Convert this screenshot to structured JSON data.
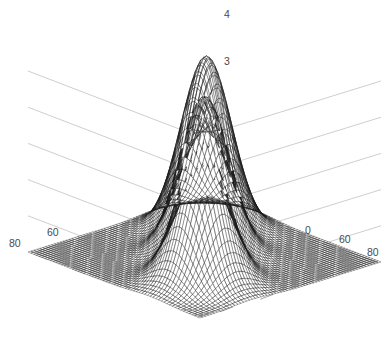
{
  "figure": {
    "background_color": "#ffffff",
    "mesh_line_color": "#1a1a1a",
    "face_color": "#ffffff",
    "grid_color": "#b9b9b9",
    "axis_color": "#8c8c8c",
    "tick_text_color": "#4a4a4a",
    "caption": ""
  },
  "chart_data": {
    "type": "surface",
    "title": "",
    "xlabel": "",
    "ylabel": "",
    "zlabel": "",
    "projection": "3d-mesh-wireframe",
    "style": "matlab-mesh",
    "grid": true,
    "legend": null,
    "x": {
      "min": 0,
      "max": 90,
      "ticks": [
        60,
        80
      ],
      "tick_labels": [
        "60",
        "80"
      ]
    },
    "y": {
      "min": 0,
      "max": 90,
      "ticks": [
        60,
        80
      ],
      "tick_labels": [
        "60",
        "80"
      ]
    },
    "z": {
      "min": 0,
      "max": 4.2,
      "ticks": [
        3,
        4
      ],
      "tick_labels": [
        "3",
        "4"
      ]
    },
    "grid_steps": {
      "nx": 62,
      "ny": 62
    },
    "peaks": [
      {
        "name": "left-peak",
        "cx": 26,
        "cy": 64,
        "amplitude": 3.18,
        "sigma": 9.2
      },
      {
        "name": "middle-peak",
        "cx": 45,
        "cy": 45,
        "amplitude": 3.62,
        "sigma": 9.2
      },
      {
        "name": "right-peak",
        "cx": 64,
        "cy": 26,
        "amplitude": 4.02,
        "sigma": 9.2
      }
    ],
    "view": {
      "azimuth": -37.5,
      "elevation": 30
    }
  },
  "z_axis": {
    "tick_4": {
      "label": "4",
      "x": 224,
      "y": 9
    },
    "tick_3": {
      "label": "3",
      "x": 224,
      "y": 56
    }
  },
  "left_axis": {
    "tick_80": {
      "label": "80",
      "x": 9,
      "y": 238
    },
    "tick_60": {
      "label": "60",
      "x": 47,
      "y": 227
    }
  },
  "right_axis": {
    "tick_60": {
      "label": "60",
      "x": 339,
      "y": 234
    },
    "tick_80": {
      "label": "80",
      "x": 367,
      "y": 247
    },
    "tick_occluded": {
      "label": "0",
      "x": 305,
      "y": 225
    }
  }
}
